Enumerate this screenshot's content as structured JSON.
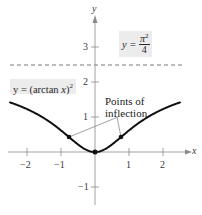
{
  "chart_data": {
    "type": "line",
    "title": "",
    "xlabel": "x",
    "ylabel": "y",
    "xlim": [
      -2.5,
      2.5
    ],
    "ylim": [
      -1.5,
      4
    ],
    "grid": false,
    "x_ticks": [
      -2,
      -1,
      1,
      2
    ],
    "x_tick_labels": [
      "−2",
      "−1",
      "1",
      "2"
    ],
    "y_ticks": [
      -1,
      1,
      2,
      3
    ],
    "y_tick_labels": [
      "−1",
      "1",
      "2",
      "3"
    ],
    "series": [
      {
        "name": "y = (arctan x)^2",
        "function": "(arctan x)^2",
        "x": [
          -2.5,
          -2,
          -1.5,
          -1,
          -0.5,
          0,
          0.5,
          1,
          1.5,
          2,
          2.5
        ],
        "values": [
          1.415,
          1.226,
          0.967,
          0.617,
          0.215,
          0,
          0.215,
          0.617,
          0.967,
          1.226,
          1.415
        ]
      }
    ],
    "asymptote": {
      "y": 2.467,
      "label": "y = π²/4",
      "style": "dashed"
    },
    "points": [
      {
        "x": -0.765,
        "y": 0.427,
        "label": "Point of inflection"
      },
      {
        "x": 0,
        "y": 0,
        "label": "Minimum"
      },
      {
        "x": 0.765,
        "y": 0.427,
        "label": "Point of inflection"
      }
    ],
    "annotations": [
      {
        "text": "Points of inflection",
        "arrows_to": [
          [
            -0.765,
            0.427
          ],
          [
            0.765,
            0.427
          ]
        ]
      }
    ],
    "legend": []
  },
  "labels": {
    "x_axis": "x",
    "y_axis": "y",
    "curve_label_prefix": "y = (arctan ",
    "curve_label_var": "x",
    "curve_label_suffix": ")",
    "curve_label_exp": "2",
    "asymptote_label_prefix": "y = ",
    "asymptote_num": "π",
    "asymptote_num_exp": "2",
    "asymptote_den": "4",
    "annotation_line1": "Points of",
    "annotation_line2": "inflection",
    "x_ticks": [
      "−2",
      "−1",
      "1",
      "2"
    ],
    "y_ticks": [
      "3",
      "2",
      "1",
      "−1"
    ]
  }
}
